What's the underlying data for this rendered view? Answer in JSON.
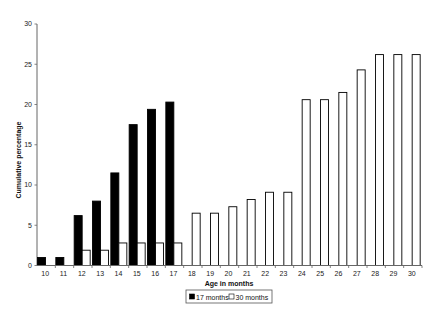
{
  "chart_data": {
    "type": "bar",
    "title": "",
    "xlabel": "Age in months",
    "ylabel": "Cumulative percentage",
    "ylim": [
      0,
      30
    ],
    "yticks": [
      0,
      5,
      10,
      15,
      20,
      25,
      30
    ],
    "grid": false,
    "legend_position": "bottom",
    "categories": [
      "10",
      "11",
      "12",
      "13",
      "14",
      "15",
      "16",
      "17",
      "18",
      "19",
      "20",
      "21",
      "22",
      "23",
      "24",
      "25",
      "26",
      "27",
      "28",
      "29",
      "30"
    ],
    "series": [
      {
        "name": "17 months",
        "fill": "#000000",
        "values": [
          1.0,
          1.0,
          6.2,
          8.0,
          11.5,
          17.5,
          19.4,
          20.3,
          null,
          null,
          null,
          null,
          null,
          null,
          null,
          null,
          null,
          null,
          null,
          null,
          null
        ]
      },
      {
        "name": "30 months",
        "fill": "#ffffff",
        "values": [
          null,
          null,
          1.9,
          1.9,
          2.8,
          2.8,
          2.8,
          2.8,
          6.5,
          6.5,
          7.3,
          8.2,
          9.1,
          9.1,
          20.6,
          20.6,
          21.5,
          24.3,
          26.2,
          26.2,
          26.2
        ]
      }
    ]
  },
  "legend": {
    "items": [
      {
        "label": "17 months",
        "swatch": "#000000"
      },
      {
        "label": "30 months",
        "swatch": "#ffffff"
      }
    ]
  }
}
